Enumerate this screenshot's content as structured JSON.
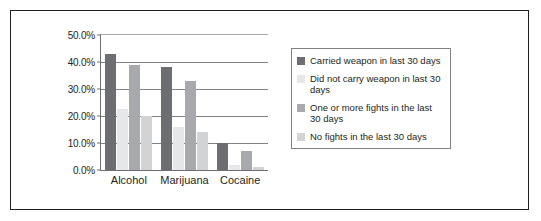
{
  "chart_data": {
    "type": "bar",
    "title": "",
    "xlabel": "",
    "ylabel": "",
    "categories": [
      "Alcohol",
      "Marijuana",
      "Cocaine"
    ],
    "ylim": [
      0,
      50
    ],
    "ytick_labels": [
      "50.0%",
      "40.0%",
      "30.0%",
      "20.0%",
      "10.0%",
      "0.0%"
    ],
    "ytick_values": [
      50,
      40,
      30,
      20,
      10,
      0
    ],
    "grid": true,
    "legend_position": "right",
    "series": [
      {
        "name": "Carried weapon in last 30 days",
        "color": "#6d6e71",
        "values": [
          43.0,
          38.0,
          10.0
        ]
      },
      {
        "name": "Did not carry weapon in last 30 days",
        "color": "#e6e7e8",
        "values": [
          22.5,
          16.0,
          2.0
        ]
      },
      {
        "name": "One or more fights in the last 30 days",
        "color": "#a7a9ac",
        "values": [
          39.0,
          33.0,
          7.0
        ]
      },
      {
        "name": "No fights in the last 30 days",
        "color": "#d1d3d4",
        "values": [
          20.0,
          14.0,
          1.2
        ]
      }
    ]
  },
  "legend": {
    "items": [
      {
        "label": "Carried weapon in last 30 days",
        "color": "#6d6e71"
      },
      {
        "label": "Did not carry weapon in last 30 days",
        "color": "#e6e7e8"
      },
      {
        "label": "One or more fights in the last 30 days",
        "color": "#a7a9ac"
      },
      {
        "label": "No fights in the last 30 days",
        "color": "#d1d3d4"
      }
    ]
  },
  "frame": {
    "border_color": "#231f20",
    "background": "#ffffff"
  }
}
